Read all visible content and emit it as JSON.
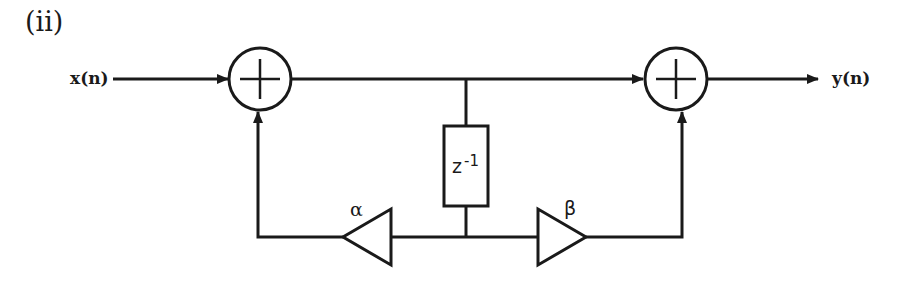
{
  "figure": {
    "part_label": "(ii)",
    "input_label": "x(n)",
    "output_label": "y(n)",
    "delay_label_base": "z",
    "delay_label_exp": "-1",
    "gain_left_label": "α",
    "gain_right_label": "β",
    "adder_symbol": "plus-icon",
    "stroke_color": "#1a1a1a"
  }
}
